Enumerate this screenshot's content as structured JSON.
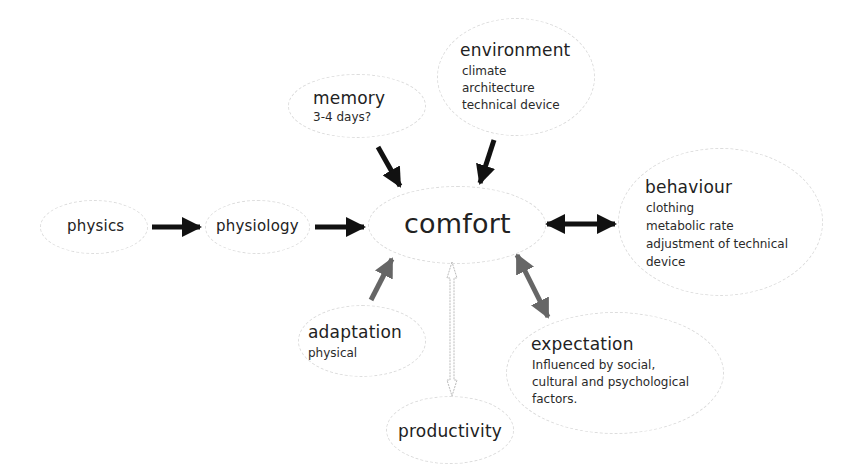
{
  "diagram": {
    "nodes": {
      "physics": {
        "title": "physics"
      },
      "physiology": {
        "title": "physiology"
      },
      "comfort": {
        "title": "comfort"
      },
      "memory": {
        "title": "memory",
        "lines": [
          "3-4 days?"
        ]
      },
      "environment": {
        "title": "environment",
        "lines": [
          "climate",
          "architecture",
          "technical device"
        ]
      },
      "behaviour": {
        "title": "behaviour",
        "lines": [
          "clothing",
          "metabolic rate",
          "adjustment of technical",
          "device"
        ]
      },
      "adaptation": {
        "title": "adaptation",
        "lines": [
          "physical"
        ]
      },
      "expectation": {
        "title": "expectation",
        "lines": [
          "Influenced by social,",
          "cultural and psychological",
          "factors."
        ]
      },
      "productivity": {
        "title": "productivity"
      }
    },
    "edges": [
      {
        "from": "physics",
        "to": "physiology",
        "style": "solid",
        "color": "#111111",
        "direction": "forward"
      },
      {
        "from": "physiology",
        "to": "comfort",
        "style": "solid",
        "color": "#111111",
        "direction": "forward"
      },
      {
        "from": "memory",
        "to": "comfort",
        "style": "solid",
        "color": "#111111",
        "direction": "forward"
      },
      {
        "from": "environment",
        "to": "comfort",
        "style": "solid",
        "color": "#111111",
        "direction": "forward"
      },
      {
        "from": "comfort",
        "to": "behaviour",
        "style": "solid",
        "color": "#111111",
        "direction": "both"
      },
      {
        "from": "adaptation",
        "to": "comfort",
        "style": "solid",
        "color": "#666666",
        "direction": "forward"
      },
      {
        "from": "comfort",
        "to": "expectation",
        "style": "solid",
        "color": "#666666",
        "direction": "both"
      },
      {
        "from": "comfort",
        "to": "productivity",
        "style": "outline",
        "color": "#bbbbbb",
        "direction": "both"
      }
    ]
  }
}
